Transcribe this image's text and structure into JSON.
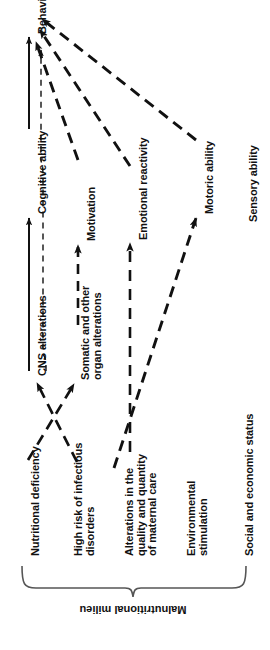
{
  "figure": {
    "orientation": "rotated-90-ccw",
    "background_color": "#ffffff",
    "ink_color": "#111111"
  },
  "outcome": {
    "label": "Behavior"
  },
  "mediators": [
    {
      "id": "cognitive",
      "label": "Cognitive ability"
    },
    {
      "id": "motivation",
      "label": "Motivation"
    },
    {
      "id": "emotional",
      "label": "Emotional reactivity"
    },
    {
      "id": "motoric",
      "label": "Motoric ability"
    },
    {
      "id": "sensory",
      "label": "Sensory ability"
    }
  ],
  "organic": [
    {
      "id": "cns",
      "label": "CNS alterations"
    },
    {
      "id": "somatic",
      "line1": "Somatic and other",
      "line2": "organ alterations"
    }
  ],
  "milieu": {
    "bracket_label": "Malnutritional milieu",
    "items": [
      {
        "id": "nutrition",
        "line1": "Nutritional deficiency",
        "line2": "",
        "line3": ""
      },
      {
        "id": "infection",
        "line1": "High risk of infectious",
        "line2": "disorders",
        "line3": ""
      },
      {
        "id": "maternal",
        "line1": "Alterations in the",
        "line2": "quality and quantity",
        "line3": "of maternal care"
      },
      {
        "id": "environment",
        "line1": "Environmental",
        "line2": "stimulation",
        "line3": ""
      },
      {
        "id": "social",
        "line1": "Social and economic status",
        "line2": "",
        "line3": ""
      }
    ]
  },
  "edges": [
    {
      "from": "cns",
      "to": "cognitive",
      "style": "solid"
    },
    {
      "from": "cognitive",
      "to": "behavior",
      "style": "solid"
    },
    {
      "from": "cns",
      "to": "behavior",
      "style": "dashed-thin"
    },
    {
      "from": "somatic",
      "to": "motivation",
      "style": "dashed"
    },
    {
      "from": "motivation",
      "to": "behavior",
      "style": "dashed"
    },
    {
      "from": "maternal",
      "to": "emotional",
      "style": "dashed"
    },
    {
      "from": "emotional",
      "to": "behavior",
      "style": "dashed"
    },
    {
      "from": "environment",
      "to": "motoric",
      "style": "dashed"
    },
    {
      "from": "motoric",
      "to": "behavior",
      "style": "dashed"
    },
    {
      "from": "nutrition",
      "to": "somatic",
      "style": "dashed"
    },
    {
      "from": "infection",
      "to": "cns",
      "style": "dashed"
    }
  ]
}
